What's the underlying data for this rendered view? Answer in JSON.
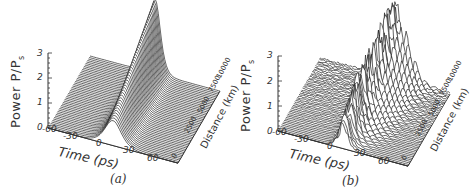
{
  "chart_data": [
    {
      "panel": "a",
      "type": "area",
      "subtype": "3d-waterfall",
      "caption": "(a)",
      "ylabel": "Power P/P",
      "ylabel_sub": "s",
      "xlabel": "Time (ps)",
      "zlabel": "Distance (km)",
      "y_ticks": [
        "0",
        "1",
        "2",
        "3"
      ],
      "x_ticks": [
        "-60",
        "-30",
        "0",
        "30",
        "60"
      ],
      "z_ticks": [
        "0",
        "2500",
        "5000",
        "7500",
        "10000"
      ],
      "ylim": [
        0,
        3
      ],
      "xlim": [
        -60,
        60
      ],
      "zlim": [
        0,
        10000
      ],
      "description": "Single stable pulse centered at t=0; peak power grows from ~1 at distance 0 to ~3 at 10000 km while narrowing",
      "series": [
        {
          "distance_km": 0,
          "peak_power": 1.0,
          "center_ps": 0
        },
        {
          "distance_km": 2500,
          "peak_power": 1.5,
          "center_ps": 0
        },
        {
          "distance_km": 5000,
          "peak_power": 2.0,
          "center_ps": 0
        },
        {
          "distance_km": 7500,
          "peak_power": 2.5,
          "center_ps": 0
        },
        {
          "distance_km": 10000,
          "peak_power": 3.0,
          "center_ps": 0
        }
      ]
    },
    {
      "panel": "b",
      "type": "area",
      "subtype": "3d-waterfall",
      "caption": "(b)",
      "ylabel": "Power P/P",
      "ylabel_sub": "s",
      "xlabel": "Time (ps)",
      "zlabel": "Distance (km)",
      "y_ticks": [
        "0",
        "1",
        "2",
        "3"
      ],
      "x_ticks": [
        "-60",
        "-30",
        "0",
        "30",
        "60"
      ],
      "z_ticks": [
        "0",
        "2500",
        "5000",
        "7500",
        "10000"
      ],
      "ylim": [
        0,
        3
      ],
      "xlim": [
        -60,
        60
      ],
      "zlim": [
        0,
        10000
      ],
      "description": "Pulse starting near power ~1 becomes unstable and breaks into noisy oscillating peaks with maxima up to ~3 near the far end",
      "series": [
        {
          "distance_km": 0,
          "peak_power": 1.0,
          "center_ps": 0
        },
        {
          "distance_km": 2500,
          "peak_power": 2.0,
          "center_ps": 0
        },
        {
          "distance_km": 5000,
          "peak_power": 2.2,
          "center_ps": 0
        },
        {
          "distance_km": 7500,
          "peak_power": 2.4,
          "center_ps": 0
        },
        {
          "distance_km": 10000,
          "peak_power": 3.0,
          "center_ps": 0
        }
      ]
    }
  ]
}
